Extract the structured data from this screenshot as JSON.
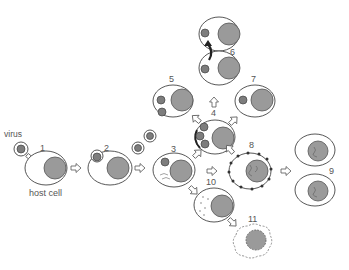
{
  "diagram": {
    "type": "virus-host-cell-interaction",
    "labels": {
      "virus": "virus",
      "host_cell": "host cell",
      "step1": "1",
      "step2": "2",
      "step3": "3",
      "step4": "4",
      "step5": "5",
      "step6": "6",
      "step7": "7",
      "step8": "8",
      "step9": "9",
      "step10": "10",
      "step11": "11"
    },
    "stages": [
      {
        "id": 1,
        "description": "virus attaches to host cell"
      },
      {
        "id": 2,
        "description": "virus enters cell"
      },
      {
        "id": 3,
        "description": "viral genome released in cell"
      },
      {
        "id": 4,
        "description": "virus replication"
      },
      {
        "id": 5,
        "description": "virions released by budding"
      },
      {
        "id": 6,
        "description": "virus passes to daughter cell"
      },
      {
        "id": 7,
        "description": "latent infection"
      },
      {
        "id": 8,
        "description": "transformed cell with surface antigens"
      },
      {
        "id": 9,
        "description": "transformed cells divide"
      },
      {
        "id": 10,
        "description": "cell damage"
      },
      {
        "id": 11,
        "description": "cell death / lysis"
      }
    ],
    "colors": {
      "nucleus": "#9a9a9a",
      "virus": "#7d7d7d",
      "outline": "#444444",
      "background": "#ffffff"
    }
  }
}
